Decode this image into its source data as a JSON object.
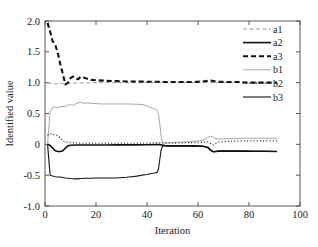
{
  "chart_data": {
    "type": "line",
    "title": "",
    "xlabel": "Iteration",
    "ylabel": "Identified value",
    "xlim": [
      0,
      100
    ],
    "ylim": [
      -1.0,
      2.0
    ],
    "xticks": [
      0,
      20,
      40,
      60,
      80,
      100
    ],
    "xtick_labels": [
      "0",
      "20",
      "40",
      "60",
      "80",
      "100"
    ],
    "yticks": [
      -1.0,
      -0.5,
      0,
      0.5,
      1.0,
      1.5,
      2.0
    ],
    "ytick_labels": [
      "-1.0",
      "-0.5",
      "0",
      "0.5",
      "1.0",
      "1.5",
      "2.0"
    ],
    "grid": false,
    "legend_position": "top-right",
    "series": [
      {
        "name": "a1",
        "color": "#9a9a9a",
        "width": 1.0,
        "dash": "4,2.5",
        "x": [
          1,
          2,
          3,
          4,
          5,
          6,
          7,
          8,
          9,
          10,
          12,
          14,
          16,
          18,
          20,
          24,
          28,
          32,
          36,
          40,
          44,
          45,
          46,
          48,
          52,
          56,
          60,
          63,
          64,
          65,
          66,
          67,
          70,
          74,
          78,
          82,
          86,
          91
        ],
        "values": [
          1.0,
          0.99,
          0.985,
          0.98,
          0.985,
          0.99,
          0.985,
          0.975,
          0.985,
          0.99,
          0.995,
          0.995,
          0.995,
          0.995,
          1.0,
          1.0,
          1.0,
          1.0,
          1.0,
          1.0,
          1.0,
          1.0,
          1.0,
          1.0,
          1.0,
          1.0,
          1.0,
          1.0,
          1.0,
          1.0,
          1.0,
          1.0,
          1.0,
          1.0,
          1.0,
          1.0,
          1.0,
          1.0
        ]
      },
      {
        "name": "a2",
        "color": "#111111",
        "width": 1.6,
        "dash": "none",
        "x": [
          1,
          2,
          3,
          4,
          5,
          6,
          7,
          8,
          9,
          10,
          12,
          14,
          16,
          20,
          24,
          28,
          32,
          36,
          40,
          44,
          45,
          46,
          47,
          48,
          50,
          54,
          58,
          62,
          64,
          65,
          66,
          67,
          68,
          70,
          74,
          78,
          82,
          86,
          91
        ],
        "values": [
          0.0,
          -0.02,
          -0.06,
          -0.105,
          -0.115,
          -0.115,
          -0.105,
          -0.06,
          -0.025,
          -0.015,
          -0.01,
          -0.01,
          -0.01,
          -0.01,
          -0.01,
          -0.008,
          -0.008,
          -0.008,
          -0.006,
          -0.005,
          -0.005,
          -0.01,
          -0.02,
          -0.025,
          -0.025,
          -0.025,
          -0.025,
          -0.03,
          -0.05,
          -0.095,
          -0.12,
          -0.115,
          -0.11,
          -0.11,
          -0.11,
          -0.11,
          -0.112,
          -0.112,
          -0.115
        ]
      },
      {
        "name": "a3",
        "color": "#111111",
        "width": 2.1,
        "dash": "5,3",
        "x": [
          1,
          2,
          3,
          4,
          5,
          6,
          7,
          8,
          9,
          10,
          11,
          12,
          13,
          14,
          15,
          16,
          18,
          20,
          24,
          28,
          32,
          36,
          40,
          44,
          46,
          50,
          54,
          58,
          62,
          64,
          65,
          66,
          68,
          72,
          76,
          80,
          84,
          88,
          91
        ],
        "values": [
          1.97,
          1.83,
          1.67,
          1.62,
          1.48,
          1.3,
          1.14,
          0.97,
          1.0,
          1.075,
          1.1,
          1.07,
          1.055,
          1.095,
          1.09,
          1.07,
          1.045,
          1.04,
          1.03,
          1.025,
          1.02,
          1.02,
          1.015,
          1.015,
          1.01,
          1.01,
          1.01,
          1.01,
          1.02,
          1.03,
          1.035,
          1.025,
          1.015,
          1.01,
          1.01,
          1.0,
          1.0,
          1.0,
          1.0
        ]
      },
      {
        "name": "b1",
        "color": "#a8a8a8",
        "width": 1.0,
        "dash": "none",
        "x": [
          1,
          2,
          3,
          4,
          5,
          6,
          7,
          8,
          9,
          10,
          11,
          12,
          13,
          14,
          15,
          16,
          18,
          20,
          22,
          24,
          28,
          32,
          36,
          38,
          40,
          41,
          42,
          43,
          44,
          44.5,
          45,
          45.5,
          46,
          47,
          48,
          50,
          52,
          55,
          58,
          60,
          62,
          63,
          64,
          65,
          66,
          67,
          68,
          70,
          74,
          78,
          82,
          86,
          91
        ],
        "values": [
          0.0,
          0.53,
          0.6,
          0.605,
          0.6,
          0.61,
          0.615,
          0.61,
          0.635,
          0.645,
          0.63,
          0.655,
          0.675,
          0.68,
          0.665,
          0.67,
          0.665,
          0.66,
          0.655,
          0.655,
          0.655,
          0.655,
          0.65,
          0.645,
          0.625,
          0.605,
          0.59,
          0.575,
          0.555,
          0.5,
          0.33,
          0.15,
          0.03,
          0.02,
          0.025,
          0.03,
          0.035,
          0.04,
          0.05,
          0.055,
          0.07,
          0.085,
          0.115,
          0.13,
          0.115,
          0.09,
          0.085,
          0.09,
          0.095,
          0.1,
          0.1,
          0.1,
          0.1
        ]
      },
      {
        "name": "b2",
        "color": "#2a2a2a",
        "width": 1.3,
        "dash": "1,2.2",
        "x": [
          1,
          2,
          3,
          4,
          5,
          6,
          7,
          8,
          9,
          10,
          12,
          14,
          16,
          18,
          20,
          24,
          28,
          32,
          36,
          40,
          44,
          46,
          48,
          50,
          54,
          58,
          60,
          62,
          63,
          64,
          65,
          66,
          67,
          68,
          70,
          74,
          78,
          82,
          86,
          91
        ],
        "values": [
          0.15,
          0.175,
          0.16,
          0.155,
          0.145,
          0.1,
          0.06,
          0.03,
          0.035,
          0.03,
          0.025,
          0.02,
          0.02,
          0.02,
          0.02,
          0.02,
          0.02,
          0.02,
          0.02,
          0.02,
          0.025,
          0.025,
          0.02,
          0.02,
          0.025,
          0.03,
          0.03,
          0.035,
          0.04,
          0.04,
          0.01,
          -0.01,
          0.015,
          0.035,
          0.045,
          0.05,
          0.055,
          0.055,
          0.055,
          0.055
        ]
      },
      {
        "name": "b3",
        "color": "#111111",
        "width": 1.1,
        "dash": "none",
        "x": [
          1,
          2,
          3,
          4,
          5,
          6,
          8,
          10,
          12,
          14,
          16,
          18,
          20,
          24,
          28,
          32,
          34,
          36,
          38,
          40,
          41,
          42,
          43,
          44,
          44.5,
          45,
          45.5,
          46,
          47,
          48,
          50,
          54,
          58,
          62,
          63,
          64,
          65,
          66,
          67,
          68,
          70,
          74,
          78,
          82,
          86,
          91
        ],
        "values": [
          0.0,
          -0.5,
          -0.515,
          -0.525,
          -0.53,
          -0.53,
          -0.545,
          -0.555,
          -0.56,
          -0.555,
          -0.55,
          -0.55,
          -0.545,
          -0.545,
          -0.545,
          -0.535,
          -0.525,
          -0.515,
          -0.5,
          -0.49,
          -0.48,
          -0.47,
          -0.465,
          -0.455,
          -0.4,
          -0.25,
          -0.1,
          -0.03,
          -0.025,
          -0.025,
          -0.025,
          -0.025,
          -0.025,
          -0.03,
          -0.04,
          -0.06,
          -0.1,
          -0.12,
          -0.115,
          -0.11,
          -0.11,
          -0.11,
          -0.11,
          -0.112,
          -0.112,
          -0.115
        ]
      }
    ]
  },
  "legend": {
    "entries": [
      {
        "label": "a1"
      },
      {
        "label": "a2"
      },
      {
        "label": "a3"
      },
      {
        "label": "b1"
      },
      {
        "label": "b2"
      },
      {
        "label": "b3"
      }
    ]
  }
}
